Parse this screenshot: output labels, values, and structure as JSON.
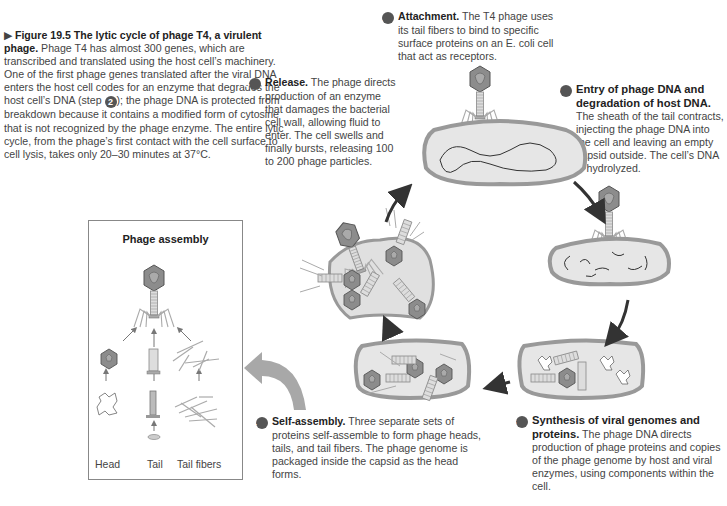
{
  "figure": {
    "label": "Figure 19.5",
    "title": "The lytic cycle of phage T4, a virulent phage.",
    "caption_body_1": "Phage T4 has almost 300 genes, which are transcribed and translated using the host cell’s machinery. One of the first phage genes translated after the viral DNA enters the host cell codes for an enzyme that degrades the host cell’s DNA (step ",
    "caption_step_ref": "2",
    "caption_body_2": "); the phage DNA is protected from breakdown because it contains a modified form of cytosine that is not recognized by the phage enzyme. The entire lytic cycle, from the phage’s first contact with the cell surface to cell lysis, takes only 20–30 minutes at 37°C."
  },
  "steps": [
    {
      "num": "1",
      "title": "Attachment.",
      "body": "The T4 phage uses its tail fibers to bind to specific surface proteins on an E. coli cell that act as receptors."
    },
    {
      "num": "2",
      "title": "Entry of phage DNA and degradation of host DNA.",
      "body": "The sheath of the tail contracts, injecting the phage DNA into the cell and leaving an empty capsid outside. The cell’s DNA is hydrolyzed."
    },
    {
      "num": "3",
      "title": "Synthesis of viral genomes and proteins.",
      "body": "The phage DNA directs production of phage proteins and copies of the phage genome by host and viral enzymes, using components within the cell."
    },
    {
      "num": "4",
      "title": "Self-assembly.",
      "body": "Three separate sets of proteins self-assemble to form phage heads, tails, and tail fibers. The phage genome is packaged inside the capsid as the head forms."
    },
    {
      "num": "5",
      "title": "Release.",
      "body": "The phage directs production of an enzyme that damages the bacterial cell wall, allowing fluid to enter. The cell swells and finally bursts, releasing 100 to 200 phage particles."
    }
  ],
  "assembly": {
    "title": "Phage assembly",
    "labels": [
      "Head",
      "Tail",
      "Tail fibers"
    ]
  },
  "colors": {
    "cell_fill": "#e8e8e8",
    "cell_wall": "#9a9a9a",
    "arrow": "#333333",
    "big_arrow": "#a8a8a8",
    "phage_head": "#8a8a8a",
    "badge": "#555555"
  }
}
